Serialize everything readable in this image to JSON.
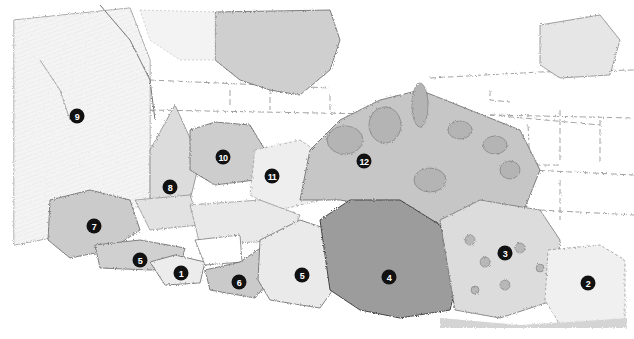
{
  "illustration": {
    "subject": "Pencil-sketch garden border planting plan with stone wall background",
    "palette": {
      "paper": "#ffffff",
      "light_foliage": "#e4e4e4",
      "mid_foliage": "#c8c8c8",
      "dark_foliage": "#9a9a9a",
      "outline": "#555555",
      "marker": "#111111"
    }
  },
  "markers": [
    {
      "label": "1"
    },
    {
      "label": "2"
    },
    {
      "label": "3"
    },
    {
      "label": "4"
    },
    {
      "label": "5"
    },
    {
      "label": "5"
    },
    {
      "label": "6"
    },
    {
      "label": "7"
    },
    {
      "label": "8"
    },
    {
      "label": "9"
    },
    {
      "label": "10"
    },
    {
      "label": "11"
    },
    {
      "label": "12"
    }
  ]
}
